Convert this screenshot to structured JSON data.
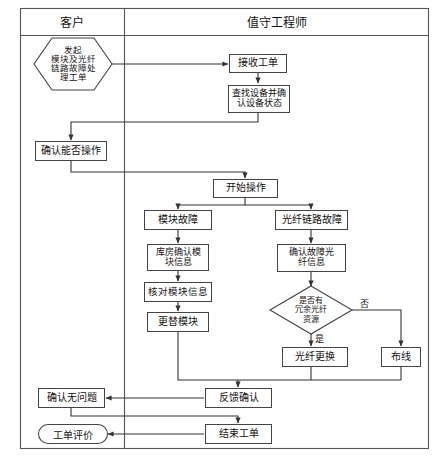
{
  "diagram": {
    "title_header": {
      "columns": [
        {
          "id": "col-customer",
          "label": "客户"
        },
        {
          "id": "col-engineer",
          "label": "值守工程师"
        }
      ]
    },
    "nodes": [
      {
        "id": "n1",
        "label": "发起\n模块及光纤\n链路故障处\n理工单",
        "shape": "hexagon",
        "lane": "customer"
      },
      {
        "id": "n2",
        "label": "接收工单",
        "shape": "rect",
        "lane": "engineer"
      },
      {
        "id": "n3",
        "label": "查找设备并确\n认设备状态",
        "shape": "rect",
        "lane": "engineer"
      },
      {
        "id": "n4",
        "label": "确认能否操作",
        "shape": "rect",
        "lane": "customer"
      },
      {
        "id": "n5",
        "label": "开始操作",
        "shape": "rect",
        "lane": "engineer"
      },
      {
        "id": "n6",
        "label": "模块故障",
        "shape": "rect",
        "lane": "engineer"
      },
      {
        "id": "n7",
        "label": "光纤链路故障",
        "shape": "rect",
        "lane": "engineer"
      },
      {
        "id": "n8",
        "label": "库房确认模\n块信息",
        "shape": "rect",
        "lane": "engineer"
      },
      {
        "id": "n9",
        "label": "核对模块信息",
        "shape": "rect",
        "lane": "engineer"
      },
      {
        "id": "n10",
        "label": "更替模块",
        "shape": "rect",
        "lane": "engineer"
      },
      {
        "id": "n11",
        "label": "确认故障光\n纤信息",
        "shape": "rect",
        "lane": "engineer"
      },
      {
        "id": "n12",
        "label": "是否有\n冗余光纤\n资源",
        "shape": "diamond",
        "lane": "engineer"
      },
      {
        "id": "n13",
        "label": "光纤更换",
        "shape": "rect",
        "lane": "engineer"
      },
      {
        "id": "n14",
        "label": "布线",
        "shape": "rect",
        "lane": "engineer"
      },
      {
        "id": "n15",
        "label": "反馈确认",
        "shape": "rect",
        "lane": "engineer"
      },
      {
        "id": "n16",
        "label": "确认无问题",
        "shape": "rect",
        "lane": "customer"
      },
      {
        "id": "n17",
        "label": "结束工单",
        "shape": "rect",
        "lane": "engineer"
      },
      {
        "id": "n18",
        "label": "工单评价",
        "shape": "stadium",
        "lane": "customer"
      }
    ],
    "edge_labels": [
      {
        "id": "e-no",
        "label": "否"
      },
      {
        "id": "e-yes",
        "label": "是"
      }
    ],
    "colors": {
      "stroke": "#444444",
      "text": "#111111",
      "background": "#ffffff"
    }
  }
}
